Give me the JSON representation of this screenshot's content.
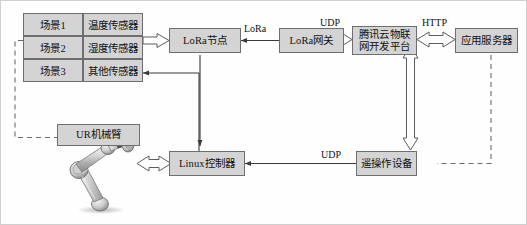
{
  "diagram": {
    "colors": {
      "box_fill": "#d4d4d4",
      "box_stroke": "#6e6e6e",
      "line": "#3a3a3a",
      "dashed_line": "#6b6b6b",
      "text": "#111111",
      "canvas_border": "#cfcfcf"
    },
    "scene_table": {
      "rows": [
        {
          "scene": "场景1",
          "sensor": "温度传感器"
        },
        {
          "scene": "场景2",
          "sensor": "湿度传感器"
        },
        {
          "scene": "场景3",
          "sensor": "其他传感器"
        }
      ]
    },
    "nodes": {
      "lora_node": "LoRa节点",
      "lora_gateway": "LoRa网关",
      "cloud_platform_line1": "腾讯云物联",
      "cloud_platform_line2": "网开发平台",
      "app_server": "应用服务器",
      "ur_arm": "UR机械臂",
      "linux_controller": "Linux控制器",
      "teleop_device": "遥操作设备"
    },
    "edge_labels": {
      "lora": "LoRa",
      "udp_top": "UDP",
      "http": "HTTP",
      "udp_bottom": "UDP"
    },
    "icons": {
      "robot_arm": "robot-arm-icon"
    }
  }
}
